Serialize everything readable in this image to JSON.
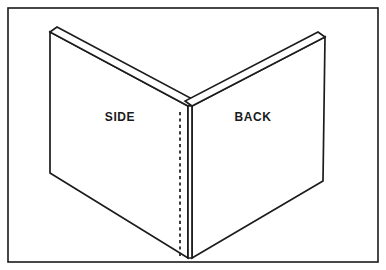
{
  "figure": {
    "type": "isometric-line-drawing",
    "background_color": "#ffffff",
    "line_color": "#1c1c1c",
    "frame": {
      "name": "outer-border",
      "x": 8,
      "y": 8,
      "width": 370,
      "height": 254,
      "stroke_color": "#1a1a1a"
    },
    "labels": [
      {
        "id": "side",
        "text": "SIDE",
        "x": 120,
        "y": 117
      },
      {
        "id": "back",
        "text": "BACK",
        "x": 253,
        "y": 117
      }
    ],
    "panels": [
      {
        "id": "side-panel",
        "label": "SIDE",
        "face_points": "50,32 188,106 188,258 50,173",
        "top_band_points": "50,32 57,27 196,101 188,106"
      },
      {
        "id": "back-panel",
        "label": "BACK",
        "face_points": "192,106 325,37 323,181 192,258",
        "top_band_points": "192,106 185,101 318,32 325,37"
      }
    ],
    "corner": {
      "id": "corner-edge-band",
      "points": "188,106 192,106 192,258 188,258",
      "hidden_edge": {
        "x": 180,
        "y1": 112,
        "y2": 256,
        "style": "dashed"
      }
    }
  }
}
